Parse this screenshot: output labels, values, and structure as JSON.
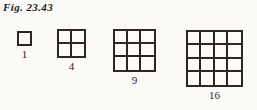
{
  "caption": {
    "text": "Fig. 23.43"
  },
  "colors": {
    "background": "#fbfaf7",
    "ink": "#2a2724",
    "caption_ink": "#231f1c",
    "cell_fill": "#fcfbf8"
  },
  "chart_data": {
    "type": "table",
    "title": "Fig. 23.43",
    "xlabel": "",
    "ylabel": "",
    "categories": [
      "1x1",
      "2x2",
      "3x3",
      "4x4"
    ],
    "values": [
      1,
      4,
      9,
      16
    ],
    "grid": true,
    "legend_position": "none",
    "annotations": [
      "1",
      "4",
      "9",
      "16"
    ]
  },
  "figures": [
    {
      "rows": 1,
      "cols": 1,
      "label": "1"
    },
    {
      "rows": 2,
      "cols": 2,
      "label": "4"
    },
    {
      "rows": 3,
      "cols": 3,
      "label": "9"
    },
    {
      "rows": 4,
      "cols": 4,
      "label": "16"
    }
  ]
}
